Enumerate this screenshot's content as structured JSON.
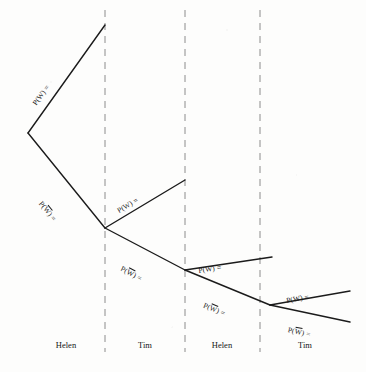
{
  "diagram": {
    "type": "probability-tree",
    "width": 366,
    "height": 372,
    "line_color": "#1b1b1b",
    "divider_color": "#8c8c8c",
    "background_color": "#fdfdfc"
  },
  "stages": [
    {
      "label": "Helen"
    },
    {
      "label": "Tim"
    },
    {
      "label": "Helen"
    },
    {
      "label": "Tim"
    }
  ],
  "dividers": [
    {
      "x": 105
    },
    {
      "x": 185
    },
    {
      "x": 260
    }
  ],
  "nodes": [
    {
      "id": "root",
      "x": 28,
      "y": 133
    },
    {
      "id": "n1",
      "x": 105,
      "y": 228
    },
    {
      "id": "n2",
      "x": 185,
      "y": 270
    },
    {
      "id": "n3",
      "x": 270,
      "y": 305
    }
  ],
  "branches": [
    {
      "id": "b1",
      "from": "root",
      "x1": 28,
      "y1": 133,
      "x2": 105,
      "y2": 25,
      "label": "P(W) =",
      "event": "W",
      "complement": false
    },
    {
      "id": "b2",
      "from": "root",
      "x1": 28,
      "y1": 133,
      "x2": 105,
      "y2": 228,
      "label": "P(W) =",
      "event": "W",
      "complement": true
    },
    {
      "id": "b3",
      "from": "n1",
      "x1": 105,
      "y1": 228,
      "x2": 185,
      "y2": 180,
      "label": "P(W) =",
      "event": "W",
      "complement": false
    },
    {
      "id": "b4",
      "from": "n1",
      "x1": 105,
      "y1": 228,
      "x2": 185,
      "y2": 270,
      "label": "P(W) =",
      "event": "W",
      "complement": true
    },
    {
      "id": "b5",
      "from": "n2",
      "x1": 185,
      "y1": 270,
      "x2": 272,
      "y2": 257,
      "label": "P(W) =",
      "event": "W",
      "complement": false
    },
    {
      "id": "b6",
      "from": "n2",
      "x1": 185,
      "y1": 270,
      "x2": 270,
      "y2": 305,
      "label": "P(W) =",
      "event": "W",
      "complement": true
    },
    {
      "id": "b7",
      "from": "n3",
      "x1": 270,
      "y1": 305,
      "x2": 350,
      "y2": 291,
      "label": "P(W) =",
      "event": "W",
      "complement": false
    },
    {
      "id": "b8",
      "from": "n3",
      "x1": 270,
      "y1": 305,
      "x2": 350,
      "y2": 322,
      "label": "P(W) =",
      "event": "W",
      "complement": true
    }
  ],
  "labels": {
    "b1": {
      "prefix": "P(",
      "event": "W",
      "suffix": ") =",
      "x": 38,
      "y": 98,
      "rotate": -54.5
    },
    "b2": {
      "prefix": "P(",
      "event": "W",
      "suffix": ") =",
      "x": 37,
      "y": 196,
      "rotate": 51.0
    },
    "b3": {
      "prefix": "P(",
      "event": "W",
      "suffix": ") =",
      "x": 120,
      "y": 206,
      "rotate": -31.0
    },
    "b4": {
      "prefix": "P(",
      "event": "W",
      "suffix": ") =",
      "x": 119,
      "y": 263,
      "rotate": 27.7
    },
    "b5": {
      "prefix": "P(",
      "event": "W",
      "suffix": ") =",
      "x": 199,
      "y": 266,
      "rotate": -8.5
    },
    "b6": {
      "prefix": "P(",
      "event": "W",
      "suffix": ") =",
      "x": 202,
      "y": 300,
      "rotate": 22.5
    },
    "b7": {
      "prefix": "P(",
      "event": "W",
      "suffix": ") =",
      "x": 287,
      "y": 296,
      "rotate": -10.0
    },
    "b8": {
      "prefix": "P(",
      "event": "W",
      "suffix": ") =",
      "x": 287,
      "y": 325,
      "rotate": 12.0
    }
  },
  "stage_label_positions": [
    {
      "x": 66,
      "y": 340
    },
    {
      "x": 145,
      "y": 340
    },
    {
      "x": 222,
      "y": 340
    },
    {
      "x": 305,
      "y": 340
    }
  ]
}
